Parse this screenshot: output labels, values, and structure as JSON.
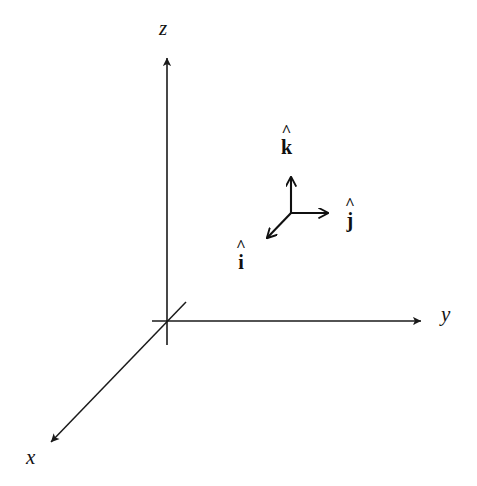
{
  "figure": {
    "background_color": "#ffffff",
    "stroke_color": "#1a1a1a",
    "width": 477,
    "height": 486
  },
  "axes": {
    "origin": {
      "x": 167,
      "y": 321
    },
    "items": [
      {
        "name": "z-axis",
        "label": "z",
        "direction": "up",
        "from": {
          "x": 167,
          "y": 345
        },
        "to": {
          "x": 167,
          "y": 52
        },
        "arrowhead": true,
        "label_pos": {
          "x": 167,
          "y": 29
        }
      },
      {
        "name": "y-axis",
        "label": "y",
        "direction": "right",
        "from": {
          "x": 152,
          "y": 321
        },
        "to": {
          "x": 428,
          "y": 321
        },
        "arrowhead": true,
        "label_pos": {
          "x": 447,
          "y": 316
        }
      },
      {
        "name": "x-axis",
        "label": "x",
        "direction": "down-left",
        "from": {
          "x": 186,
          "y": 302
        },
        "to": {
          "x": 46,
          "y": 447
        },
        "arrowhead": true,
        "label_pos": {
          "x": 33,
          "y": 459
        }
      }
    ]
  },
  "unit_vectors": {
    "triad_origin": {
      "x": 291,
      "y": 213
    },
    "items": [
      {
        "name": "k-hat",
        "label": "k",
        "hat": "^",
        "direction": "up",
        "from": {
          "x": 291,
          "y": 213
        },
        "to": {
          "x": 291,
          "y": 170
        },
        "label_pos": {
          "x": 291,
          "y": 141
        }
      },
      {
        "name": "j-hat",
        "label": "j",
        "hat": "^",
        "direction": "right",
        "from": {
          "x": 291,
          "y": 213
        },
        "to": {
          "x": 335,
          "y": 213
        },
        "label_pos": {
          "x": 354,
          "y": 213
        }
      },
      {
        "name": "i-hat",
        "label": "i",
        "hat": "^",
        "direction": "down-left",
        "from": {
          "x": 291,
          "y": 213
        },
        "to": {
          "x": 262,
          "y": 243
        },
        "label_pos": {
          "x": 245,
          "y": 256
        }
      }
    ]
  }
}
